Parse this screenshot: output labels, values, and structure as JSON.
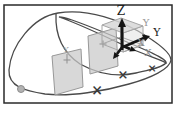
{
  "figure": {
    "colors": {
      "background": "#ffffff",
      "border": "#2a2a2a",
      "curve": "#4a4a4a",
      "plane_fill": "#c9c9c9",
      "plane_stroke": "#989898",
      "plane_marker": "#8f8f8f",
      "box_stroke": "#a6a6a6",
      "box_top_fill": "#d7d7d7",
      "box_side_fill": "#e2e2e2",
      "arrow": "#141414",
      "marker": "#3a3a3a",
      "dot_fill": "#b3b3b3",
      "dot_stroke": "#8c8c8c"
    },
    "axis_labels": {
      "z_black": {
        "text": "Z",
        "x": 121,
        "y": 15,
        "color": "#1a1a1a",
        "size": 12
      },
      "y_gray": {
        "text": "Y",
        "x": 146,
        "y": 26,
        "color": "#9a9a9a",
        "size": 10
      },
      "y_black": {
        "text": "Y",
        "x": 157,
        "y": 36,
        "color": "#1a1a1a",
        "size": 11
      },
      "x_gray_upper": {
        "text": "X",
        "x": 141,
        "y": 46,
        "color": "#8a8a8a",
        "size": 10
      },
      "x_gray_lower": {
        "text": "X",
        "x": 148,
        "y": 56,
        "color": "#8a8a8a",
        "size": 10
      },
      "plane_left_y": {
        "text": "Y",
        "x": 66,
        "y": 52,
        "color": "#9a9a9a",
        "size": 8
      }
    },
    "curve_markers": {
      "cross_symbol": "×",
      "crosses": [
        {
          "x": 97,
          "y": 90,
          "size": 14
        },
        {
          "x": 123,
          "y": 74,
          "size": 13
        },
        {
          "x": 152,
          "y": 68,
          "size": 11
        }
      ],
      "dot": {
        "cx": 21,
        "cy": 89,
        "r": 3.5
      }
    }
  }
}
